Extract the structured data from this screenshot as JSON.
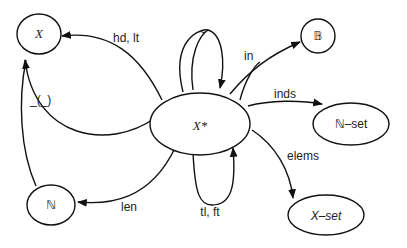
{
  "diagram": {
    "title": "",
    "nodes": {
      "center": {
        "label": "X*"
      },
      "x": {
        "label": "X"
      },
      "nat": {
        "label": "ℕ"
      },
      "bool": {
        "label": "𝔹"
      },
      "natset": {
        "label": "ℕ–set"
      },
      "xset": {
        "label": "X–set"
      }
    },
    "edges": {
      "hd_tl": {
        "label": "hd, lt",
        "from": "X*",
        "to": "X"
      },
      "index": {
        "label": "_(_)",
        "from": "X*",
        "to": "X"
      },
      "len": {
        "label": "len",
        "from": "X*",
        "to": "ℕ"
      },
      "concat": {
        "label": "~",
        "from": "X*",
        "to": "X*"
      },
      "tlft": {
        "label": "tl, ft",
        "from": "X*",
        "to": "X*"
      },
      "in": {
        "label": "in",
        "from": "X*",
        "to": "𝔹"
      },
      "inds": {
        "label": "inds",
        "from": "X*",
        "to": "ℕ–set"
      },
      "elems": {
        "label": "elems",
        "from": "X*",
        "to": "X–set"
      }
    },
    "colors": {
      "stroke": "#111111",
      "background": "#ffffff"
    }
  }
}
